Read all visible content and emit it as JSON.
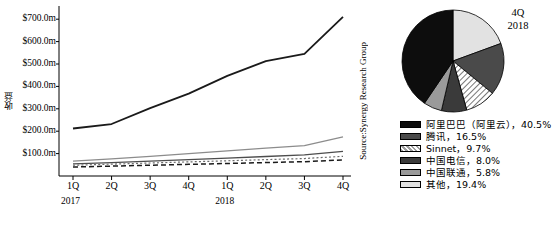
{
  "chart_data": [
    {
      "type": "line",
      "title": "",
      "xlabel": "",
      "ylabel": "收益",
      "source": "Source:Synergy Research Group",
      "grid": false,
      "legend_position": "right",
      "ylim": [
        0,
        750
      ],
      "ytick_labels": [
        "$700.0m",
        "$600.0m",
        "$500.0m",
        "$400.0m",
        "$300.0m",
        "$200.0m",
        "$100.0m"
      ],
      "ytick_values": [
        700,
        600,
        500,
        400,
        300,
        200,
        100
      ],
      "categories": [
        "1Q",
        "2Q",
        "3Q",
        "4Q",
        "1Q",
        "2Q",
        "3Q",
        "4Q"
      ],
      "year_groups": [
        {
          "label": "2017",
          "span": 4
        },
        {
          "label": "2018",
          "span": 4
        }
      ],
      "series": [
        {
          "name": "阿里巴巴（阿里云）",
          "style": "solid",
          "color": "#1a1a1a",
          "width": 1.8,
          "values": [
            212,
            232,
            303,
            368,
            447,
            513,
            545,
            710
          ]
        },
        {
          "name": "腾讯",
          "style": "solid",
          "color": "#8c8c8c",
          "width": 1.3,
          "values": [
            66,
            76,
            88,
            100,
            112,
            124,
            136,
            175
          ]
        },
        {
          "name": "Sinnet",
          "style": "solid",
          "color": "#4d4d4d",
          "width": 1.3,
          "values": [
            54,
            60,
            66,
            73,
            80,
            87,
            94,
            110
          ]
        },
        {
          "name": "中国电信",
          "style": "dotted",
          "color": "#6b6b6b",
          "width": 1.2,
          "values": [
            48,
            53,
            58,
            63,
            68,
            73,
            78,
            88
          ]
        },
        {
          "name": "中国联通",
          "style": "dashed",
          "color": "#1a1a1a",
          "width": 1.5,
          "values": [
            40,
            44,
            48,
            52,
            56,
            60,
            64,
            72
          ]
        }
      ]
    },
    {
      "type": "pie",
      "title": "4Q",
      "subtitle": "2018",
      "labels": [
        "阿里巴巴（阿里云），40.5%",
        "腾讯，16.5%",
        "Sinnet，9.7%",
        "中国电信，8.0%",
        "中国联通，5.8%",
        "其他，19.4%"
      ],
      "values": [
        40.5,
        16.5,
        9.7,
        8.0,
        5.8,
        19.4
      ],
      "slice_colors": [
        "#0d0d0d",
        "#4a4a4a",
        "#d8d8d8",
        "#3a3a3a",
        "#9a9a9a",
        "#e2e2e2"
      ]
    }
  ],
  "line_chart": {
    "ylabel": "收益",
    "source": "Source:Synergy Research Group",
    "yticks": [
      {
        "label": "$700.0m"
      },
      {
        "label": "$600.0m"
      },
      {
        "label": "$500.0m"
      },
      {
        "label": "$400.0m"
      },
      {
        "label": "$300.0m"
      },
      {
        "label": "$200.0m"
      },
      {
        "label": "$100.0m"
      }
    ],
    "xticks": [
      {
        "label": "1Q"
      },
      {
        "label": "2Q"
      },
      {
        "label": "3Q"
      },
      {
        "label": "4Q"
      },
      {
        "label": "1Q"
      },
      {
        "label": "2Q"
      },
      {
        "label": "3Q"
      },
      {
        "label": "4Q"
      }
    ],
    "years": [
      {
        "label": "2017"
      },
      {
        "label": "2018"
      }
    ]
  },
  "pie_chart": {
    "title_line1": "4Q",
    "title_line2": "2018"
  },
  "legend": {
    "items": [
      {
        "label": "阿里巴巴（阿里云），40.5%"
      },
      {
        "label": "腾讯，16.5%"
      },
      {
        "label": "Sinnet，9.7%"
      },
      {
        "label": "中国电信，8.0%"
      },
      {
        "label": "中国联通，5.8%"
      },
      {
        "label": "其他，19.4%"
      }
    ]
  }
}
